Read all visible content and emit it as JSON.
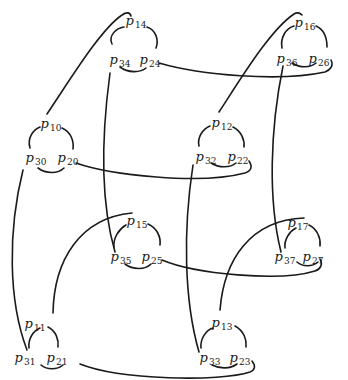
{
  "diagram": {
    "type": "braid-like knot diagram with labeled triangular crossing clusters",
    "stroke_color": "#1a1a1a",
    "background": "#ffffff",
    "nodes": [
      {
        "id": "p14",
        "base": "p",
        "sub": "14",
        "x": 136,
        "y": 20
      },
      {
        "id": "p34",
        "base": "p",
        "sub": "34",
        "x": 120,
        "y": 59
      },
      {
        "id": "p24",
        "base": "p",
        "sub": "24",
        "x": 150,
        "y": 59
      },
      {
        "id": "p16",
        "base": "p",
        "sub": "16",
        "x": 305,
        "y": 22
      },
      {
        "id": "p36",
        "base": "p",
        "sub": "36",
        "x": 287,
        "y": 58
      },
      {
        "id": "p26",
        "base": "p",
        "sub": "26",
        "x": 319,
        "y": 58
      },
      {
        "id": "p10",
        "base": "p",
        "sub": "10",
        "x": 51,
        "y": 123
      },
      {
        "id": "p30",
        "base": "p",
        "sub": "30",
        "x": 36,
        "y": 157
      },
      {
        "id": "p20",
        "base": "p",
        "sub": "20",
        "x": 68,
        "y": 157
      },
      {
        "id": "p12",
        "base": "p",
        "sub": "12",
        "x": 222,
        "y": 122
      },
      {
        "id": "p32",
        "base": "p",
        "sub": "32",
        "x": 206,
        "y": 156
      },
      {
        "id": "p22",
        "base": "p",
        "sub": "22",
        "x": 238,
        "y": 156
      },
      {
        "id": "p15",
        "base": "p",
        "sub": "15",
        "x": 137,
        "y": 220
      },
      {
        "id": "p35",
        "base": "p",
        "sub": "35",
        "x": 121,
        "y": 256
      },
      {
        "id": "p25",
        "base": "p",
        "sub": "25",
        "x": 152,
        "y": 256
      },
      {
        "id": "p17",
        "base": "p",
        "sub": "17",
        "x": 298,
        "y": 222
      },
      {
        "id": "p37",
        "base": "p",
        "sub": "37",
        "x": 285,
        "y": 256
      },
      {
        "id": "p27",
        "base": "p",
        "sub": "27",
        "x": 313,
        "y": 256
      },
      {
        "id": "p11",
        "base": "p",
        "sub": "11",
        "x": 35,
        "y": 323
      },
      {
        "id": "p31",
        "base": "p",
        "sub": "31",
        "x": 25,
        "y": 357
      },
      {
        "id": "p21",
        "base": "p",
        "sub": "21",
        "x": 57,
        "y": 357
      },
      {
        "id": "p13",
        "base": "p",
        "sub": "13",
        "x": 222,
        "y": 322
      },
      {
        "id": "p33",
        "base": "p",
        "sub": "33",
        "x": 210,
        "y": 357
      },
      {
        "id": "p23",
        "base": "p",
        "sub": "23",
        "x": 240,
        "y": 357
      }
    ],
    "connections": [
      {
        "from": "p10",
        "to": "p14",
        "kind": "long arc"
      },
      {
        "from": "p12",
        "to": "p16",
        "kind": "long arc"
      },
      {
        "from": "p11",
        "to": "p15",
        "kind": "long arc"
      },
      {
        "from": "p13",
        "to": "p17",
        "kind": "long arc"
      },
      {
        "from": "p34",
        "to": "p35",
        "kind": "vertical strand"
      },
      {
        "from": "p36",
        "to": "p37",
        "kind": "vertical strand"
      },
      {
        "from": "p30",
        "to": "p31",
        "kind": "vertical strand"
      },
      {
        "from": "p32",
        "to": "p33",
        "kind": "vertical strand"
      },
      {
        "from": "p24",
        "to": "p26",
        "kind": "horizontal strand"
      },
      {
        "from": "p20",
        "to": "p22",
        "kind": "horizontal strand"
      },
      {
        "from": "p25",
        "to": "p27",
        "kind": "horizontal strand"
      },
      {
        "from": "p21",
        "to": "p23",
        "kind": "horizontal strand"
      }
    ]
  }
}
